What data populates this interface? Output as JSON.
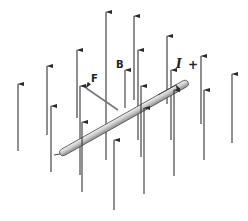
{
  "diagram": {
    "type": "physics-illustration",
    "labels": {
      "field": "B",
      "force": "F",
      "current": "I",
      "polarity": "+"
    },
    "colors": {
      "background": "#ffffff",
      "field_arrow": "#333333",
      "force_arrow": "#777777",
      "wire_fill": "#d8d8d8",
      "wire_edge": "#555555"
    },
    "field_arrows_back": [
      {
        "x": 106,
        "y1": 160,
        "y2": 12
      },
      {
        "x": 134,
        "y1": 100,
        "y2": 16
      },
      {
        "x": 77,
        "y1": 118,
        "y2": 50
      },
      {
        "x": 167,
        "y1": 104,
        "y2": 36
      },
      {
        "x": 47,
        "y1": 135,
        "y2": 66
      },
      {
        "x": 201,
        "y1": 124,
        "y2": 56
      },
      {
        "x": 18,
        "y1": 151,
        "y2": 84
      },
      {
        "x": 232,
        "y1": 143,
        "y2": 74
      },
      {
        "x": 80,
        "y1": 175,
        "y2": 86
      },
      {
        "x": 138,
        "y1": 140,
        "y2": 50
      },
      {
        "x": 171,
        "y1": 140,
        "y2": 70
      }
    ],
    "field_arrows_front": [
      {
        "x": 51,
        "y1": 172,
        "y2": 106
      },
      {
        "x": 82,
        "y1": 192,
        "y2": 122
      },
      {
        "x": 114,
        "y1": 210,
        "y2": 140
      },
      {
        "x": 141,
        "y1": 157,
        "y2": 86
      },
      {
        "x": 144,
        "y1": 194,
        "y2": 108
      },
      {
        "x": 174,
        "y1": 176,
        "y2": 90
      },
      {
        "x": 204,
        "y1": 160,
        "y2": 90
      }
    ],
    "b_arrow": {
      "x": 125,
      "y1": 108,
      "y2": 70
    },
    "f_arrow": {
      "x1": 118,
      "y1": 110,
      "x2": 86,
      "y2": 88
    },
    "wire": {
      "x1": 60,
      "y1": 154,
      "x2": 188,
      "y2": 82,
      "thickness": 7
    },
    "current_arrow": {
      "x1": 158,
      "y1": 95,
      "x2": 176,
      "y2": 85
    }
  }
}
